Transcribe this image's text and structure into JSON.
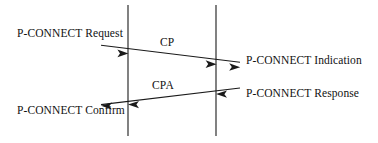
{
  "diagram": {
    "type": "sequence-diagram",
    "colors": {
      "background": "#ffffff",
      "stroke": "#1a1a1a",
      "text": "#111111"
    },
    "lifelines": [
      {
        "name": "left-lifeline",
        "x": 128,
        "y_top": 5,
        "y_bottom": 136
      },
      {
        "name": "right-lifeline",
        "x": 216,
        "y_top": 5,
        "y_bottom": 136
      }
    ],
    "messages": [
      {
        "id": "cp",
        "label": "CP",
        "direction": "left-to-right",
        "from_x": 101,
        "from_y": 45,
        "to_x": 240,
        "to_y": 62,
        "arrowheads_at": [
          128,
          216,
          240
        ]
      },
      {
        "id": "cpa",
        "label": "CPA",
        "direction": "right-to-left",
        "from_x": 240,
        "from_y": 88,
        "to_x": 101,
        "to_y": 104,
        "arrowheads_at": [
          216,
          128,
          101
        ]
      }
    ],
    "labels": {
      "request": "P-CONNECT Request",
      "indication": "P-CONNECT Indication",
      "response": "P-CONNECT Response",
      "confirm": "P-CONNECT Confirm"
    }
  }
}
